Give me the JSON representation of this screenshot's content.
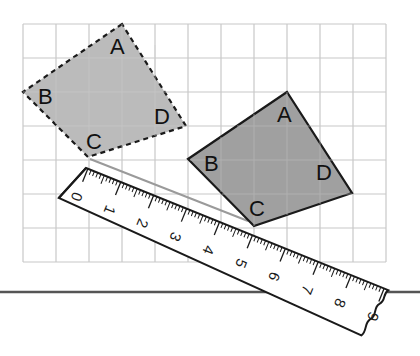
{
  "figure": {
    "grid": {
      "x0": 23,
      "y0": 24,
      "cols": 11,
      "rows": 7,
      "cell": 33,
      "line_color": "#c8c8c8"
    },
    "original_square": {
      "style": "dashed",
      "fill": "#b4b4b4",
      "labels": {
        "A": "A",
        "B": "B",
        "C": "C",
        "D": "D"
      }
    },
    "image_square": {
      "style": "solid",
      "fill": "#a0a0a0",
      "labels": {
        "A": "A",
        "B": "B",
        "C": "C",
        "D": "D"
      }
    },
    "ruler": {
      "numbers": [
        "0",
        "1",
        "2",
        "3",
        "4",
        "5",
        "6",
        "7",
        "8",
        "9"
      ],
      "unit": "cm"
    },
    "colors": {
      "outline": "#1a1a1a",
      "connector_line": "#9a9a9a",
      "baseline": "#555555"
    }
  }
}
